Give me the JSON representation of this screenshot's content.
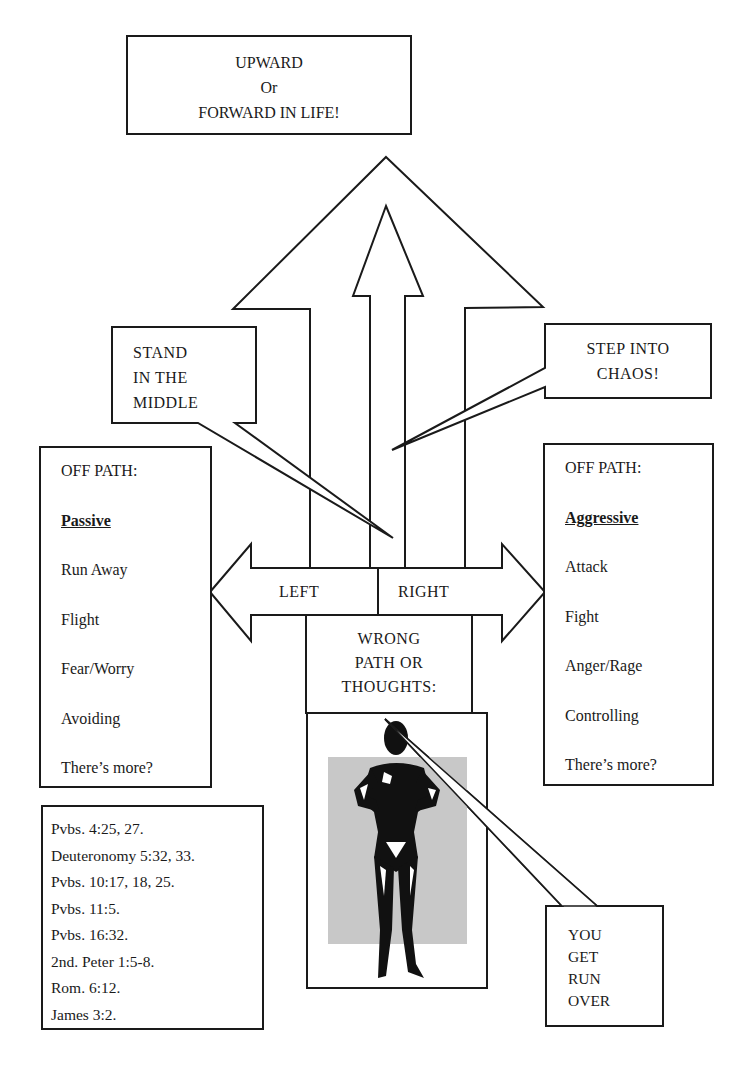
{
  "top_box": {
    "line1": "UPWARD",
    "line2": "Or",
    "line3": "FORWARD IN LIFE!"
  },
  "callouts": {
    "middle": [
      "STAND",
      "IN THE",
      "MIDDLE"
    ],
    "chaos": [
      "STEP INTO",
      "CHAOS!"
    ],
    "run_over": [
      "YOU",
      "GET",
      "RUN",
      "OVER"
    ]
  },
  "crossroad": {
    "left_label": "LEFT",
    "right_label": "RIGHT"
  },
  "wrong_path": [
    "WRONG",
    "PATH OR",
    "THOUGHTS:"
  ],
  "left_panel": {
    "heading": "OFF PATH:",
    "category": "Passive",
    "items": [
      "Run Away",
      "Flight",
      "Fear/Worry",
      "Avoiding",
      "There’s more?"
    ]
  },
  "right_panel": {
    "heading": "OFF PATH:",
    "category": "Aggressive",
    "items": [
      "Attack",
      "Fight",
      "Anger/Rage",
      "Controlling",
      "There’s more?"
    ]
  },
  "references": [
    "Pvbs. 4:25, 27.",
    "Deuteronomy 5:32, 33.",
    "Pvbs. 10:17, 18, 25.",
    "Pvbs. 11:5.",
    "Pvbs. 16:32.",
    "2nd. Peter 1:5-8.",
    "Rom. 6:12.",
    "James 3:2."
  ],
  "figure": {
    "icon": "standing-man-silhouette-icon",
    "backdrop_color": "#c8c8c8"
  },
  "colors": {
    "stroke": "#1a1a1a",
    "background": "#ffffff"
  }
}
